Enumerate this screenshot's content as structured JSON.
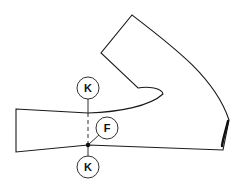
{
  "diagram": {
    "type": "pattern-piece",
    "labels": {
      "k_top": "K",
      "f_point": "F",
      "k_bottom": "K"
    },
    "colors": {
      "stroke": "#1a1a1a",
      "background": "#ffffff"
    }
  }
}
